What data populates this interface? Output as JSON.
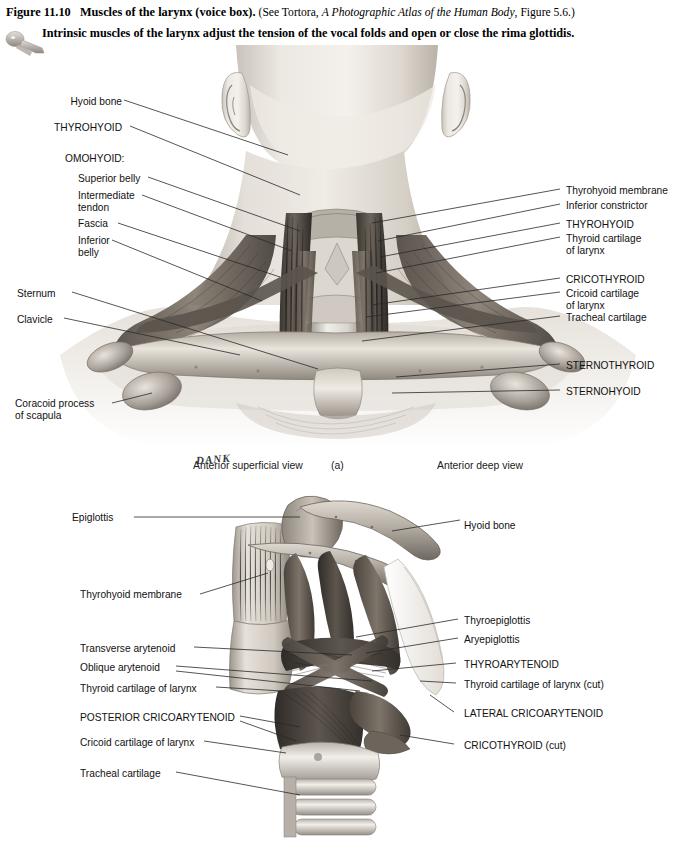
{
  "header": {
    "figure_number": "Figure 11.10",
    "figure_title": "Muscles of the larynx (voice box).",
    "source_prefix": "(See Tortora,",
    "source_italic": "A Photographic Atlas of the Human Body",
    "source_suffix": ", Figure 5.6.)",
    "subtitle": "Intrinsic muscles of the larynx adjust the tension of the vocal folds and open or close the rima glottidis.",
    "icon": "larynx-icon"
  },
  "panel_a": {
    "captions": {
      "left": "Anterior superficial view",
      "center": "(a)",
      "right": "Anterior deep view"
    },
    "artist_signature": "DANK",
    "left_labels": [
      {
        "text": "Hyoid bone",
        "x": 65,
        "y": 96
      },
      {
        "text": "THYROHYOID",
        "x": 65,
        "y": 122
      },
      {
        "text": "OMOHYOID:",
        "x": 65,
        "y": 153
      },
      {
        "text": "Superior belly",
        "x": 78,
        "y": 173
      },
      {
        "text": "Intermediate\ntendon",
        "x": 78,
        "y": 190
      },
      {
        "text": "Fascia",
        "x": 78,
        "y": 218
      },
      {
        "text": "Inferior\nbelly",
        "x": 78,
        "y": 235
      },
      {
        "text": "Sternum",
        "x": 17,
        "y": 288
      },
      {
        "text": "Clavicle",
        "x": 17,
        "y": 314
      },
      {
        "text": "Coracoid process\nof scapula",
        "x": 15,
        "y": 398
      }
    ],
    "right_labels": [
      {
        "text": "Thyrohyoid membrane",
        "x": 566,
        "y": 185
      },
      {
        "text": "Inferior constrictor",
        "x": 566,
        "y": 200
      },
      {
        "text": "THYROHYOID",
        "x": 566,
        "y": 219
      },
      {
        "text": "Thyroid cartilage\nof larynx",
        "x": 566,
        "y": 233
      },
      {
        "text": "CRICOTHYROID",
        "x": 566,
        "y": 274
      },
      {
        "text": "Cricoid cartilage\nof larynx",
        "x": 566,
        "y": 288
      },
      {
        "text": "Tracheal cartilage",
        "x": 566,
        "y": 312
      },
      {
        "text": "STERNOTHYROID",
        "x": 566,
        "y": 360
      },
      {
        "text": "STERNOHYOID",
        "x": 566,
        "y": 386
      }
    ]
  },
  "panel_b": {
    "left_labels": [
      {
        "text": "Epiglottis",
        "x": 72,
        "y": 512
      },
      {
        "text": "Thyrohyoid membrane",
        "x": 80,
        "y": 589
      },
      {
        "text": "Transverse arytenoid",
        "x": 80,
        "y": 643
      },
      {
        "text": "Oblique arytenoid",
        "x": 80,
        "y": 662
      },
      {
        "text": "Thyroid cartilage of larynx",
        "x": 80,
        "y": 683
      },
      {
        "text": "POSTERIOR CRICOARYTENOID",
        "x": 80,
        "y": 712
      },
      {
        "text": "Cricoid cartilage of larynx",
        "x": 80,
        "y": 737
      },
      {
        "text": "Tracheal cartilage",
        "x": 80,
        "y": 768
      }
    ],
    "right_labels": [
      {
        "text": "Hyoid bone",
        "x": 464,
        "y": 520
      },
      {
        "text": "Thyroepiglottis",
        "x": 464,
        "y": 615
      },
      {
        "text": "Aryepiglottis",
        "x": 464,
        "y": 634
      },
      {
        "text": "THYROARYTENOID",
        "x": 464,
        "y": 659
      },
      {
        "text": "Thyroid cartilage of larynx (cut)",
        "x": 464,
        "y": 679
      },
      {
        "text": "LATERAL CRICOARYTENOID",
        "x": 464,
        "y": 708
      },
      {
        "text": "CRICOTHYROID (cut)",
        "x": 464,
        "y": 740
      }
    ]
  },
  "colors": {
    "ink": "#111111",
    "leader": "#2a2a2a",
    "page": "#ffffff",
    "tissue_dark": "#4a4440",
    "tissue_mid": "#8b8279",
    "tissue_light": "#cfc8bf",
    "skin_light": "#d8d2cb",
    "cartilage": "#e8e4de"
  }
}
